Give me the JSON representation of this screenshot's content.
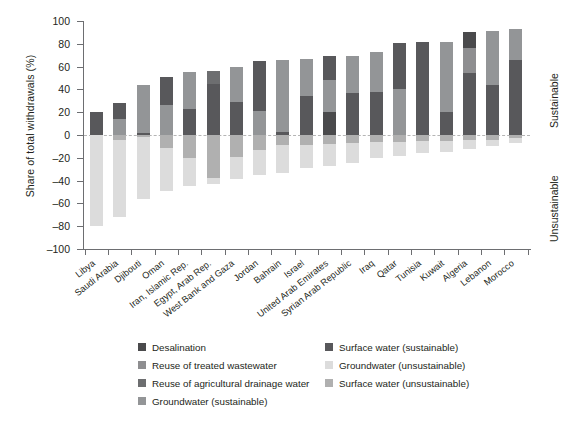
{
  "chart_data": {
    "type": "bar",
    "title": "",
    "subtitle": "",
    "xlabel": "",
    "ylabel": "Share of total withdrawals (%)",
    "ylim": [
      -100,
      100
    ],
    "ytick_values": [
      100,
      80,
      60,
      40,
      20,
      0,
      -20,
      -40,
      -60,
      -80,
      -100
    ],
    "ytick_labels": [
      "100",
      "80",
      "60",
      "40",
      "20",
      "0",
      "–20",
      "–40",
      "–60",
      "–80",
      "–100"
    ],
    "grid": false,
    "stacked": true,
    "zero_reference_line": true,
    "legend_position": "bottom",
    "side_annotations": {
      "above_zero": "Sustainable",
      "below_zero": "Unsustainable"
    },
    "categories": [
      "Libya",
      "Saudi Arabia",
      "Djibouti",
      "Oman",
      "Iran, Islamic Rep.",
      "Egypt, Arab Rep.",
      "West Bank and Gaza",
      "Jordan",
      "Bahrain",
      "Israel",
      "United Arab Emirates",
      "Syrian Arab Republic",
      "Iraq",
      "Qatar",
      "Tunisia",
      "Kuwait",
      "Algeria",
      "Lebanon",
      "Morocco"
    ],
    "series": [
      {
        "name": "Desalination",
        "color": "#4a4a4c",
        "values": [
          0,
          0,
          0,
          0,
          0,
          0,
          0,
          0,
          10,
          0,
          20,
          0,
          0,
          10,
          0,
          27,
          9,
          0,
          0
        ]
      },
      {
        "name": "Reuse of treated wastewater",
        "color": "#8e8e90",
        "values": [
          0,
          0,
          0,
          0,
          0,
          0,
          0,
          0,
          0,
          0,
          0,
          0,
          0,
          0,
          0,
          0,
          0,
          0,
          0
        ]
      },
      {
        "name": "Reuse of agricultural drainage water",
        "color": "#6d6e70",
        "values": [
          0,
          0,
          0,
          0,
          0,
          0,
          0,
          0,
          0,
          0,
          0,
          0,
          0,
          0,
          0,
          0,
          0,
          0,
          0
        ]
      },
      {
        "name": "Groundwater (sustainable)",
        "color": "#939597",
        "values": [
          0,
          14,
          42,
          25,
          32,
          11,
          31,
          45,
          0,
          19,
          0,
          39,
          42,
          0,
          0,
          0,
          0,
          0,
          0
        ]
      },
      {
        "name": "Surface water (sustainable)",
        "color": "#58585b",
        "values": [
          20,
          14,
          2,
          26,
          23,
          45,
          29,
          21,
          56,
          49,
          49,
          34,
          40,
          72,
          82,
          63,
          84,
          93,
          93
        ]
      },
      {
        "name": "Groundwater (unsustainable)",
        "color": "#d9d9d9",
        "values": [
          -80,
          -72,
          -56,
          -49,
          -45,
          -43,
          -39,
          -35,
          -33,
          -29,
          -27,
          -25,
          -20,
          -18,
          -16,
          -15,
          -12,
          -10,
          -7
        ]
      },
      {
        "name": "Surface water (unsustainable)",
        "color": "#b0b0b0",
        "values": [
          0,
          -4,
          -2,
          -11,
          -20,
          -38,
          -19,
          -13,
          -9,
          -9,
          -8,
          -7,
          -6,
          -6,
          -5,
          -5,
          -4,
          -4,
          -3
        ]
      }
    ],
    "bar_stacks": [
      {
        "category": "Libya",
        "top": 20,
        "bottom": -80,
        "pos": [
          [
            "Surface water (sustainable)",
            20
          ]
        ],
        "neg": [
          [
            "Groundwater (unsustainable)",
            -80
          ]
        ]
      },
      {
        "category": "Saudi Arabia",
        "top": 28,
        "bottom": -72,
        "pos": [
          [
            "Groundwater (sustainable)",
            14
          ],
          [
            "Surface water (sustainable)",
            14
          ]
        ],
        "neg": [
          [
            "Surface water (unsustainable)",
            -4
          ],
          [
            "Groundwater (unsustainable)",
            -68
          ]
        ]
      },
      {
        "category": "Djibouti",
        "top": 44,
        "bottom": -56,
        "pos": [
          [
            "Surface water (sustainable)",
            2
          ],
          [
            "Groundwater (sustainable)",
            42
          ]
        ],
        "neg": [
          [
            "Surface water (unsustainable)",
            -2
          ],
          [
            "Groundwater (unsustainable)",
            -54
          ]
        ]
      },
      {
        "category": "Oman",
        "top": 51,
        "bottom": -49,
        "pos": [
          [
            "Groundwater (sustainable)",
            26
          ],
          [
            "Surface water (sustainable)",
            25
          ]
        ],
        "neg": [
          [
            "Surface water (unsustainable)",
            -11
          ],
          [
            "Groundwater (unsustainable)",
            -38
          ]
        ]
      },
      {
        "category": "Iran, Islamic Rep.",
        "top": 55,
        "bottom": -45,
        "pos": [
          [
            "Surface water (sustainable)",
            23
          ],
          [
            "Groundwater (sustainable)",
            32
          ]
        ],
        "neg": [
          [
            "Surface water (unsustainable)",
            -20
          ],
          [
            "Groundwater (unsustainable)",
            -25
          ]
        ]
      },
      {
        "category": "Egypt, Arab Rep.",
        "top": 56,
        "bottom": -43,
        "pos": [
          [
            "Surface water (sustainable)",
            45
          ],
          [
            "Reuse of agricultural drainage water",
            11
          ]
        ],
        "neg": [
          [
            "Surface water (unsustainable)",
            -38
          ],
          [
            "Groundwater (unsustainable)",
            -5
          ]
        ]
      },
      {
        "category": "West Bank and Gaza",
        "top": 60,
        "bottom": -39,
        "pos": [
          [
            "Surface water (sustainable)",
            29
          ],
          [
            "Groundwater (sustainable)",
            31
          ]
        ],
        "neg": [
          [
            "Surface water (unsustainable)",
            -19
          ],
          [
            "Groundwater (unsustainable)",
            -20
          ]
        ]
      },
      {
        "category": "Jordan",
        "top": 65,
        "bottom": -35,
        "pos": [
          [
            "Groundwater (sustainable)",
            21
          ],
          [
            "Surface water (sustainable)",
            44
          ]
        ],
        "neg": [
          [
            "Surface water (unsustainable)",
            -13
          ],
          [
            "Groundwater (unsustainable)",
            -22
          ]
        ]
      },
      {
        "category": "Bahrain",
        "top": 66,
        "bottom": -33,
        "pos": [
          [
            "Surface water (sustainable)",
            3
          ],
          [
            "Groundwater (sustainable)",
            63
          ]
        ],
        "neg": [
          [
            "Surface water (unsustainable)",
            -9
          ],
          [
            "Groundwater (unsustainable)",
            -24
          ]
        ]
      },
      {
        "category": "Israel",
        "top": 67,
        "bottom": -29,
        "pos": [
          [
            "Surface water (sustainable)",
            34
          ],
          [
            "Groundwater (sustainable)",
            33
          ]
        ],
        "neg": [
          [
            "Surface water (unsustainable)",
            -9
          ],
          [
            "Groundwater (unsustainable)",
            -20
          ]
        ]
      },
      {
        "category": "United Arab Emirates",
        "top": 69,
        "bottom": -27,
        "pos": [
          [
            "Desalination",
            20
          ],
          [
            "Groundwater (sustainable)",
            28
          ],
          [
            "Surface water (sustainable)",
            21
          ]
        ],
        "neg": [
          [
            "Surface water (unsustainable)",
            -8
          ],
          [
            "Groundwater (unsustainable)",
            -19
          ]
        ]
      },
      {
        "category": "Syrian Arab Republic",
        "top": 69,
        "bottom": -25,
        "pos": [
          [
            "Surface water (sustainable)",
            37
          ],
          [
            "Groundwater (sustainable)",
            32
          ]
        ],
        "neg": [
          [
            "Surface water (unsustainable)",
            -7
          ],
          [
            "Groundwater (unsustainable)",
            -18
          ]
        ]
      },
      {
        "category": "Iraq",
        "top": 73,
        "bottom": -20,
        "pos": [
          [
            "Surface water (sustainable)",
            38
          ],
          [
            "Groundwater (sustainable)",
            35
          ]
        ],
        "neg": [
          [
            "Surface water (unsustainable)",
            -6
          ],
          [
            "Groundwater (unsustainable)",
            -14
          ]
        ]
      },
      {
        "category": "Qatar",
        "top": 81,
        "bottom": -18,
        "pos": [
          [
            "Groundwater (sustainable)",
            40
          ],
          [
            "Surface water (sustainable)",
            41
          ]
        ],
        "neg": [
          [
            "Surface water (unsustainable)",
            -6
          ],
          [
            "Groundwater (unsustainable)",
            -12
          ]
        ]
      },
      {
        "category": "Tunisia",
        "top": 82,
        "bottom": -16,
        "pos": [
          [
            "Surface water (sustainable)",
            82
          ]
        ],
        "neg": [
          [
            "Surface water (unsustainable)",
            -5
          ],
          [
            "Groundwater (unsustainable)",
            -11
          ]
        ]
      },
      {
        "category": "Kuwait",
        "top": 82,
        "bottom": -15,
        "pos": [
          [
            "Surface water (sustainable)",
            20
          ],
          [
            "Groundwater (sustainable)",
            62
          ]
        ],
        "neg": [
          [
            "Surface water (unsustainable)",
            -5
          ],
          [
            "Groundwater (unsustainable)",
            -10
          ]
        ]
      },
      {
        "category": "Algeria",
        "top": 90,
        "bottom": -12,
        "pos": [
          [
            "Surface water (sustainable)",
            54
          ],
          [
            "Reuse of treated wastewater",
            22
          ],
          [
            "Desalination",
            14
          ]
        ],
        "neg": [
          [
            "Surface water (unsustainable)",
            -4
          ],
          [
            "Groundwater (unsustainable)",
            -8
          ]
        ]
      },
      {
        "category": "Lebanon",
        "top": 91,
        "bottom": -10,
        "pos": [
          [
            "Surface water (sustainable)",
            44
          ],
          [
            "Groundwater (sustainable)",
            47
          ]
        ],
        "neg": [
          [
            "Surface water (unsustainable)",
            -4
          ],
          [
            "Groundwater (unsustainable)",
            -6
          ]
        ]
      },
      {
        "category": "Morocco",
        "top": 93,
        "bottom": -7,
        "pos": [
          [
            "Surface water (sustainable)",
            66
          ],
          [
            "Groundwater (sustainable)",
            27
          ]
        ],
        "neg": [
          [
            "Surface water (unsustainable)",
            -3
          ],
          [
            "Groundwater (unsustainable)",
            -4
          ]
        ]
      }
    ]
  },
  "axis": {
    "y_title": "Share of total withdrawals (%)",
    "y_labels": [
      "100",
      "80",
      "60",
      "40",
      "20",
      "0",
      "–20",
      "–40",
      "–60",
      "–80",
      "–100"
    ],
    "x_labels": [
      "Libya",
      "Saudi Arabia",
      "Djibouti",
      "Oman",
      "Iran, Islamic Rep.",
      "Egypt, Arab Rep.",
      "West Bank and Gaza",
      "Jordan",
      "Bahrain",
      "Israel",
      "United Arab Emirates",
      "Syrian Arab Republic",
      "Iraq",
      "Qatar",
      "Tunisia",
      "Kuwait",
      "Algeria",
      "Lebanon",
      "Morocco"
    ]
  },
  "side_labels": {
    "sustainable": "Sustainable",
    "unsustainable": "Unsustainable"
  },
  "legend": {
    "column1": [
      {
        "label": "Desalination",
        "color": "#4a4a4c"
      },
      {
        "label": "Reuse of treated wastewater",
        "color": "#8e8e90"
      },
      {
        "label": "Reuse of agricultural drainage water",
        "color": "#6d6e70"
      },
      {
        "label": "Groundwater (sustainable)",
        "color": "#939597"
      }
    ],
    "column2": [
      {
        "label": "Surface water (sustainable)",
        "color": "#58585b"
      },
      {
        "label": "Groundwater (unsustainable)",
        "color": "#dcdcdc"
      },
      {
        "label": "Surface water (unsustainable)",
        "color": "#b0b0b0"
      }
    ]
  },
  "colors": {
    "desalination": "#4a4a4c",
    "reuse_treated_wastewater": "#8e8e90",
    "reuse_agri_drainage": "#6d6e70",
    "groundwater_sustainable": "#939597",
    "surface_sustainable": "#58585b",
    "groundwater_unsustainable": "#dcdcdc",
    "surface_unsustainable": "#b0b0b0",
    "axis": "#6d6e71",
    "text": "#231f20",
    "zero_line": "#b5b5b5"
  }
}
